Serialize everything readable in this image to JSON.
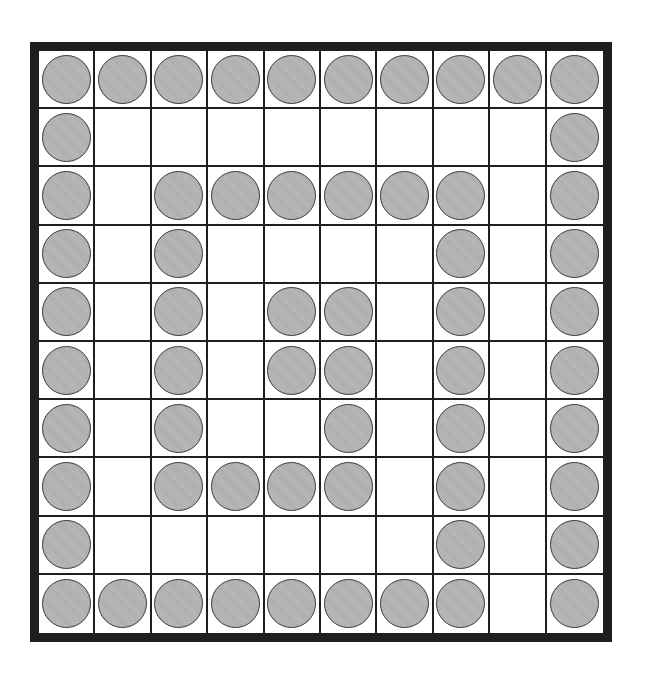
{
  "board": {
    "rows": 10,
    "cols": 10,
    "colors": {
      "border": "#1e1e1e",
      "cell": "#ffffff",
      "piece_fill": "#b4b4b4",
      "piece_outline": "#3a3a3a"
    },
    "grid": [
      [
        1,
        1,
        1,
        1,
        1,
        1,
        1,
        1,
        1,
        1
      ],
      [
        1,
        0,
        0,
        0,
        0,
        0,
        0,
        0,
        0,
        1
      ],
      [
        1,
        0,
        1,
        1,
        1,
        1,
        1,
        1,
        0,
        1
      ],
      [
        1,
        0,
        1,
        0,
        0,
        0,
        0,
        1,
        0,
        1
      ],
      [
        1,
        0,
        1,
        0,
        1,
        1,
        0,
        1,
        0,
        1
      ],
      [
        1,
        0,
        1,
        0,
        1,
        1,
        0,
        1,
        0,
        1
      ],
      [
        1,
        0,
        1,
        0,
        0,
        1,
        0,
        1,
        0,
        1
      ],
      [
        1,
        0,
        1,
        1,
        1,
        1,
        0,
        1,
        0,
        1
      ],
      [
        1,
        0,
        0,
        0,
        0,
        0,
        0,
        1,
        0,
        1
      ],
      [
        1,
        1,
        1,
        1,
        1,
        1,
        1,
        1,
        0,
        1
      ]
    ],
    "piece_count": 58
  }
}
